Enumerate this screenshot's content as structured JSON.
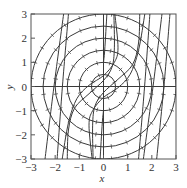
{
  "chart_data": {
    "type": "line",
    "title": "",
    "xlabel": "x",
    "ylabel": "y",
    "xlim": [
      -3,
      3
    ],
    "ylim": [
      -3,
      3
    ],
    "xticks": [
      -3,
      -2,
      -1,
      0,
      1,
      2,
      3
    ],
    "yticks": [
      -3,
      -2,
      -1,
      0,
      1,
      2,
      3
    ],
    "xtick_labels": [
      "−3",
      "−2",
      "−1",
      "0",
      "1",
      "2",
      "3"
    ],
    "ytick_labels": [
      "−3",
      "−2",
      "−1",
      "0",
      "1",
      "2",
      "3"
    ],
    "grid": false,
    "legend": null,
    "axes_lines": {
      "x_axis_at_y0": true,
      "y_axis_at_x0": true
    },
    "circles": {
      "description": "concentric circular trajectories centered at origin with direction-field tick marks",
      "radii": [
        0.5,
        1.0,
        1.5,
        2.0,
        2.5,
        3.0
      ],
      "ticks_per_circle": [
        8,
        12,
        16,
        20,
        24,
        28
      ]
    },
    "curves": {
      "description": "S-shaped / near-vertical curve family (approximate polylines)",
      "series": [
        {
          "name": "curve-1",
          "points": [
            [
              -2.42,
              -3
            ],
            [
              -2.05,
              0
            ],
            [
              -1.65,
              3
            ]
          ]
        },
        {
          "name": "curve-2",
          "points": [
            [
              -1.92,
              -3
            ],
            [
              -1.7,
              0
            ],
            [
              -1.45,
              3
            ]
          ]
        },
        {
          "name": "curve-3",
          "points": [
            [
              -1.71,
              -3
            ],
            [
              -1.45,
              -1.5
            ],
            [
              -1.1,
              -0.5
            ],
            [
              -0.6,
              0.05
            ],
            [
              0.0,
              0.45
            ],
            [
              0.45,
              1.0
            ],
            [
              0.6,
              1.6
            ],
            [
              0.47,
              3
            ]
          ]
        },
        {
          "name": "curve-4",
          "points": [
            [
              -0.43,
              -3
            ],
            [
              -0.45,
              -1.6
            ],
            [
              -0.35,
              -0.8
            ],
            [
              0.0,
              -0.25
            ],
            [
              0.6,
              0.3
            ],
            [
              1.2,
              0.9
            ],
            [
              1.45,
              1.8
            ],
            [
              1.5,
              3
            ]
          ]
        },
        {
          "name": "curve-5",
          "points": [
            [
              -0.14,
              -3
            ],
            [
              -0.05,
              -1.5
            ],
            [
              0.0,
              -1.0
            ]
          ]
        },
        {
          "name": "curve-6",
          "points": [
            [
              0.0,
              1.0
            ],
            [
              0.05,
              1.5
            ],
            [
              0.14,
              3
            ]
          ]
        },
        {
          "name": "curve-7",
          "points": [
            [
              -1.5,
              -3
            ],
            [
              -1.45,
              -1.8
            ],
            [
              -1.2,
              -0.9
            ],
            [
              -0.6,
              -0.3
            ],
            [
              0.0,
              0.25
            ],
            [
              0.35,
              0.8
            ],
            [
              0.45,
              1.6
            ],
            [
              0.43,
              3
            ]
          ]
        },
        {
          "name": "curve-8",
          "points": [
            [
              -0.47,
              -3
            ],
            [
              -0.6,
              -1.6
            ],
            [
              -0.45,
              -1.0
            ],
            [
              0.0,
              -0.45
            ],
            [
              0.6,
              -0.05
            ],
            [
              1.1,
              0.5
            ],
            [
              1.45,
              1.5
            ],
            [
              1.71,
              3
            ]
          ]
        },
        {
          "name": "curve-9",
          "points": [
            [
              1.45,
              -3
            ],
            [
              1.7,
              0
            ],
            [
              1.92,
              3
            ]
          ]
        },
        {
          "name": "curve-10",
          "points": [
            [
              1.65,
              -3
            ],
            [
              2.05,
              0
            ],
            [
              2.42,
              3
            ]
          ]
        },
        {
          "name": "curve-11",
          "points": [
            [
              2.2,
              -3
            ],
            [
              2.5,
              0
            ],
            [
              2.75,
              3
            ]
          ]
        }
      ]
    },
    "colors": {
      "line": "#3a3a3a",
      "frame": "#555555",
      "background": "#ffffff"
    }
  }
}
